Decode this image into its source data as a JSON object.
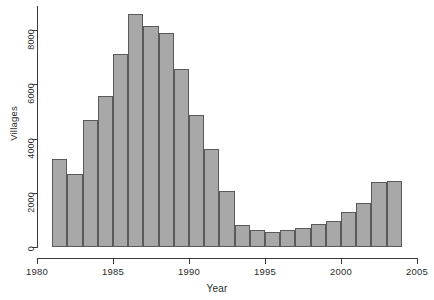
{
  "chart_data": {
    "type": "bar",
    "title": "",
    "subtitle": "",
    "xlabel": "Year",
    "ylabel": "Villages",
    "xlim": [
      1980,
      2005
    ],
    "ylim": [
      0,
      8800
    ],
    "grid": false,
    "legend": null,
    "bar_style": {
      "fill": "#a8a8a8",
      "stroke": "#5a5a5a",
      "bin_width_years": 1
    },
    "x_ticks": [
      1980,
      1985,
      1990,
      1995,
      2000,
      2005
    ],
    "x_tick_labels": [
      "1980",
      "1985",
      "1990",
      "1995",
      "2000",
      "2005"
    ],
    "y_ticks": [
      0,
      2000,
      4000,
      6000,
      8000
    ],
    "y_tick_labels": [
      "0",
      "2000",
      "4000",
      "6000",
      "8000"
    ],
    "categories": [
      1981,
      1982,
      1983,
      1984,
      1985,
      1986,
      1987,
      1988,
      1989,
      1990,
      1991,
      1992,
      1993,
      1994,
      1995,
      1996,
      1997,
      1998,
      1999,
      2000,
      2001,
      2002,
      2003
    ],
    "values": [
      3250,
      2680,
      4700,
      5550,
      7100,
      8600,
      8150,
      7900,
      6550,
      4850,
      3600,
      2050,
      800,
      630,
      540,
      620,
      700,
      840,
      960,
      1280,
      1620,
      2400,
      2450
    ]
  },
  "axis": {
    "y_title": "Villages",
    "x_title": "Year"
  }
}
